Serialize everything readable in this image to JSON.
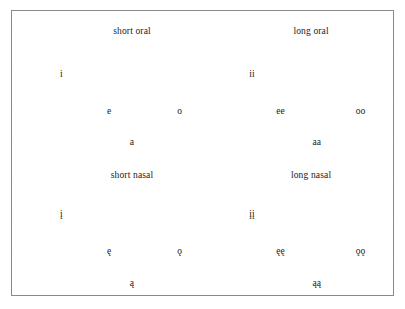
{
  "figure": {
    "type": "vowel-inventory-chart",
    "border_color": "#8a8a8a",
    "background_color": "#ffffff",
    "text_color": "#1a1a1a"
  },
  "quadrants": [
    {
      "id": "short-oral",
      "label": "short oral",
      "label_x": 31.5,
      "label_y": 7.5,
      "vowels": [
        {
          "text": "i",
          "x": 13.0,
          "y": 22.5
        },
        {
          "text": "e",
          "x": 25.5,
          "y": 35.5
        },
        {
          "text": "o",
          "x": 44.0,
          "y": 35.5
        },
        {
          "text": "a",
          "x": 31.5,
          "y": 46.5
        }
      ]
    },
    {
      "id": "long-oral",
      "label": "long oral",
      "label_x": 78.5,
      "label_y": 7.5,
      "vowels": [
        {
          "text": "ii",
          "x": 63.0,
          "y": 22.5
        },
        {
          "text": "ee",
          "x": 70.5,
          "y": 35.5
        },
        {
          "text": "oo",
          "x": 91.5,
          "y": 35.5
        },
        {
          "text": "aa",
          "x": 80.0,
          "y": 46.5
        }
      ]
    },
    {
      "id": "short-nasal",
      "label": "short nasal",
      "label_x": 31.5,
      "label_y": 58.0,
      "vowels": [
        {
          "text": "į",
          "x": 13.0,
          "y": 72.0
        },
        {
          "text": "ę",
          "x": 25.5,
          "y": 85.0
        },
        {
          "text": "ǫ",
          "x": 44.0,
          "y": 85.0
        },
        {
          "text": "ą",
          "x": 31.5,
          "y": 96.0
        }
      ]
    },
    {
      "id": "long-nasal",
      "label": "long nasal",
      "label_x": 78.5,
      "label_y": 58.0,
      "vowels": [
        {
          "text": "įį",
          "x": 63.0,
          "y": 72.0
        },
        {
          "text": "ęę",
          "x": 70.5,
          "y": 85.0
        },
        {
          "text": "ǫǫ",
          "x": 91.5,
          "y": 85.0
        },
        {
          "text": "ąą",
          "x": 80.0,
          "y": 96.0
        }
      ]
    }
  ]
}
